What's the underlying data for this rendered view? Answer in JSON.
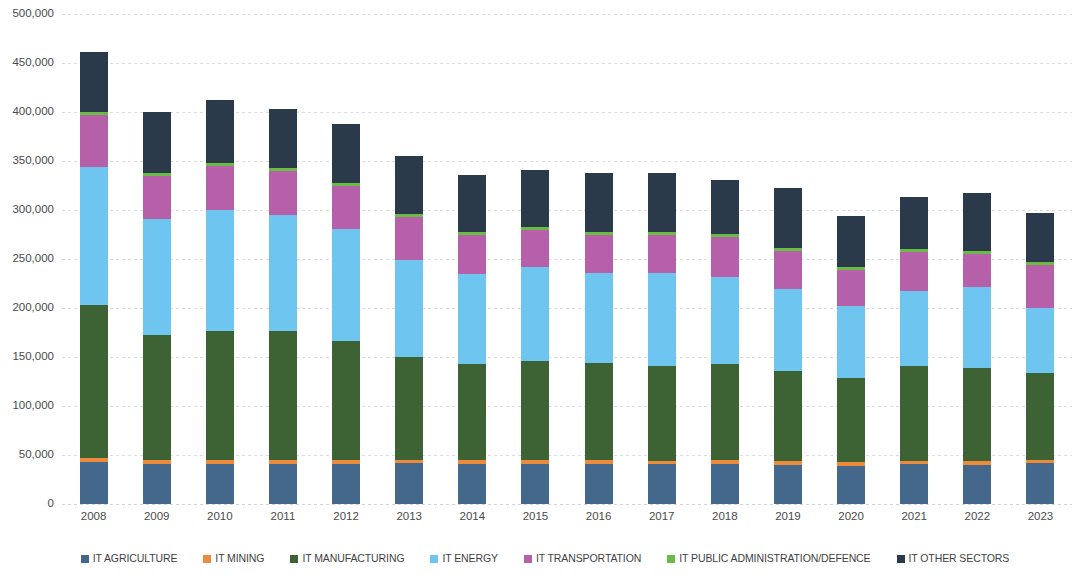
{
  "chart_data": {
    "type": "bar",
    "stacked": true,
    "title": "",
    "subtitle": "",
    "xlabel": "",
    "ylabel": "",
    "ylim": [
      0,
      500000
    ],
    "ytick_values": [
      0,
      50000,
      100000,
      150000,
      200000,
      250000,
      300000,
      350000,
      400000,
      450000,
      500000
    ],
    "ytick_labels": [
      "0",
      "50,000",
      "100,000",
      "150,000",
      "200,000",
      "250,000",
      "300,000",
      "350,000",
      "400,000",
      "450,000",
      "500,000"
    ],
    "grid": true,
    "legend_position": "bottom",
    "categories": [
      "2008",
      "2009",
      "2010",
      "2011",
      "2012",
      "2013",
      "2014",
      "2015",
      "2016",
      "2017",
      "2018",
      "2019",
      "2020",
      "2021",
      "2022",
      "2023"
    ],
    "series": [
      {
        "name": "IT AGRICULTURE",
        "color": "#44688C",
        "values": [
          42700,
          41000,
          41000,
          41000,
          41000,
          41500,
          41000,
          41000,
          41000,
          40500,
          41000,
          40000,
          39000,
          40500,
          40000,
          41500
        ]
      },
      {
        "name": "IT MINING",
        "color": "#ED8B3A",
        "values": [
          4200,
          4000,
          4000,
          4000,
          4000,
          3500,
          3500,
          3500,
          3500,
          3500,
          3500,
          3500,
          3500,
          3500,
          3500,
          3000
        ]
      },
      {
        "name": "IT MANUFACTURING",
        "color": "#3D6334",
        "values": [
          156100,
          127000,
          132000,
          132000,
          121000,
          105000,
          98000,
          101000,
          99000,
          97000,
          98000,
          92000,
          86000,
          97000,
          95000,
          89500
        ]
      },
      {
        "name": "IT ENERGY",
        "color": "#6EC6F0",
        "values": [
          140600,
          119000,
          123000,
          118000,
          115000,
          99000,
          92000,
          96000,
          92000,
          95000,
          89000,
          84000,
          74000,
          76000,
          83000,
          66000
        ]
      },
      {
        "name": "IT TRANSPORTATION",
        "color": "#B560A8",
        "values": [
          53200,
          44000,
          45000,
          45000,
          44000,
          44000,
          40000,
          38000,
          39000,
          39000,
          41000,
          39000,
          36000,
          40000,
          34000,
          44000
        ]
      },
      {
        "name": "IT PUBLIC ADMINISTRATION/DEFENCE",
        "color": "#68BC45",
        "values": [
          3200,
          3000,
          3000,
          3000,
          3000,
          3000,
          3000,
          3000,
          3000,
          3000,
          3000,
          3000,
          3000,
          3000,
          3000,
          3000
        ]
      },
      {
        "name": "IT OTHER SECTORS",
        "color": "#2B3A4A",
        "values": [
          61000,
          62000,
          64000,
          60000,
          60000,
          59000,
          58500,
          58000,
          60000,
          59500,
          55000,
          60500,
          52000,
          53000,
          59000,
          50000
        ]
      }
    ],
    "totals": [
      461000,
      400000,
      412000,
      403000,
      388000,
      355000,
      336000,
      340500,
      337500,
      337500,
      330500,
      322000,
      293500,
      313000,
      314500,
      297000
    ]
  },
  "legend": {
    "items": [
      {
        "label": "IT AGRICULTURE",
        "color": "#44688C"
      },
      {
        "label": "IT MINING",
        "color": "#ED8B3A"
      },
      {
        "label": "IT MANUFACTURING",
        "color": "#3D6334"
      },
      {
        "label": "IT ENERGY",
        "color": "#6EC6F0"
      },
      {
        "label": "IT TRANSPORTATION",
        "color": "#B560A8"
      },
      {
        "label": "IT PUBLIC ADMINISTRATION/DEFENCE",
        "color": "#68BC45"
      },
      {
        "label": "IT OTHER SECTORS",
        "color": "#2B3A4A"
      }
    ]
  }
}
